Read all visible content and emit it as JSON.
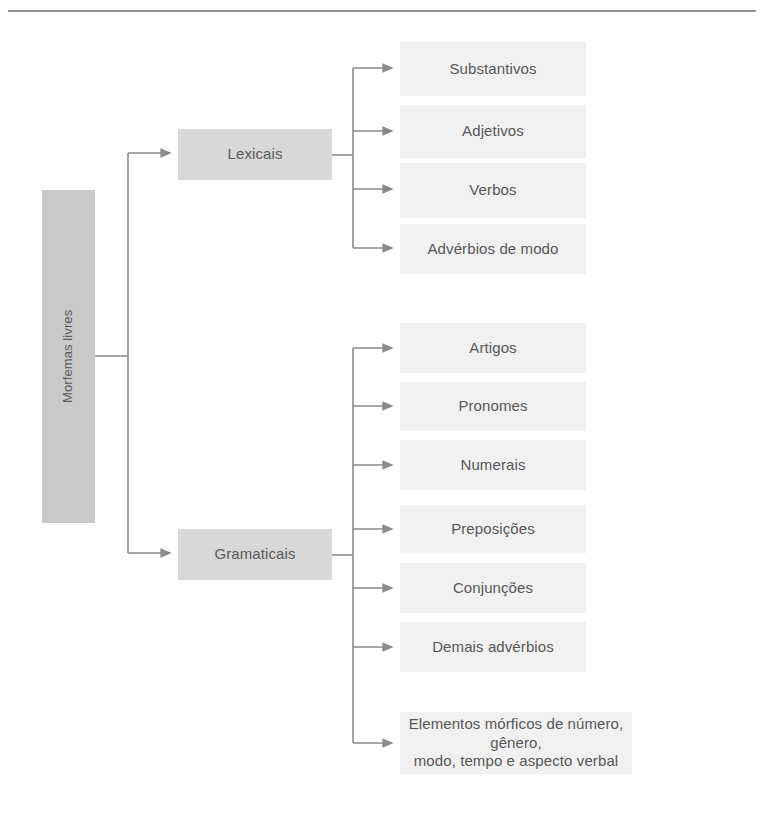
{
  "page": {
    "background_color": "#ffffff",
    "rule_color": "#6b6b6b"
  },
  "colors": {
    "root_box": "#c9c9c9",
    "branch_box": "#d8d8d8",
    "leaf_box": "#f1f1f1",
    "text": "#575757",
    "connector": "#8a8a8a"
  },
  "diagram": {
    "type": "tree",
    "orientation": "left-to-right",
    "root": {
      "label": "Morfemas livres"
    },
    "branches": [
      {
        "id": "lexicais",
        "label": "Lexicais",
        "children": [
          {
            "label": "Substantivos"
          },
          {
            "label": "Adjetivos"
          },
          {
            "label": "Verbos"
          },
          {
            "label": "Advérbios de modo"
          }
        ]
      },
      {
        "id": "gramaticais",
        "label": "Gramaticais",
        "children": [
          {
            "label": "Artigos"
          },
          {
            "label": "Pronomes"
          },
          {
            "label": "Numerais"
          },
          {
            "label": "Preposições"
          },
          {
            "label": "Conjunções"
          },
          {
            "label": "Demais advérbios"
          },
          {
            "label": "Elementos mórficos de número, gênero,\nmodo, tempo e aspecto verbal"
          }
        ]
      }
    ]
  }
}
